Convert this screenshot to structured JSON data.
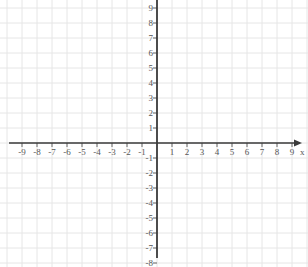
{
  "figure": {
    "width": 308,
    "height": 267,
    "background_color": "#ffffff",
    "grid_color": "#e6e6e6",
    "axis_color": "#3a3a3a",
    "label_color": "#565656"
  },
  "chart_data": {
    "type": "scatter",
    "title": "",
    "subtitle": "",
    "xlabel": "x",
    "ylabel": "",
    "xlim": [
      -9.8,
      9.8
    ],
    "ylim": [
      -8.2,
      9.5
    ],
    "grid": true,
    "grid_spacing": 1,
    "legend": null,
    "series": [],
    "x": [],
    "y": [],
    "annotations": [],
    "x_tick_labels": [
      "-9",
      "-8",
      "-7",
      "-6",
      "-5",
      "-4",
      "-3",
      "-2",
      "-1",
      "1",
      "2",
      "3",
      "4",
      "5",
      "6",
      "7",
      "8",
      "9"
    ],
    "x_tick_values": [
      -9,
      -8,
      -7,
      -6,
      -5,
      -4,
      -3,
      -2,
      -1,
      1,
      2,
      3,
      4,
      5,
      6,
      7,
      8,
      9
    ],
    "y_tick_labels": [
      "9",
      "8",
      "7",
      "6",
      "5",
      "4",
      "3",
      "2",
      "1",
      "-1",
      "-2",
      "-3",
      "-4",
      "-5",
      "-6",
      "-7",
      "-8"
    ],
    "y_tick_values": [
      9,
      8,
      7,
      6,
      5,
      4,
      3,
      2,
      1,
      -1,
      -2,
      -3,
      -4,
      -5,
      -6,
      -7,
      -8
    ],
    "origin_label": "",
    "x_axis_name": "x",
    "y_axis_name": "",
    "x_axis_arrow": "right",
    "y_axis_arrow": "none"
  },
  "icons": {
    "x_axis_arrow": "arrow-right-icon"
  }
}
